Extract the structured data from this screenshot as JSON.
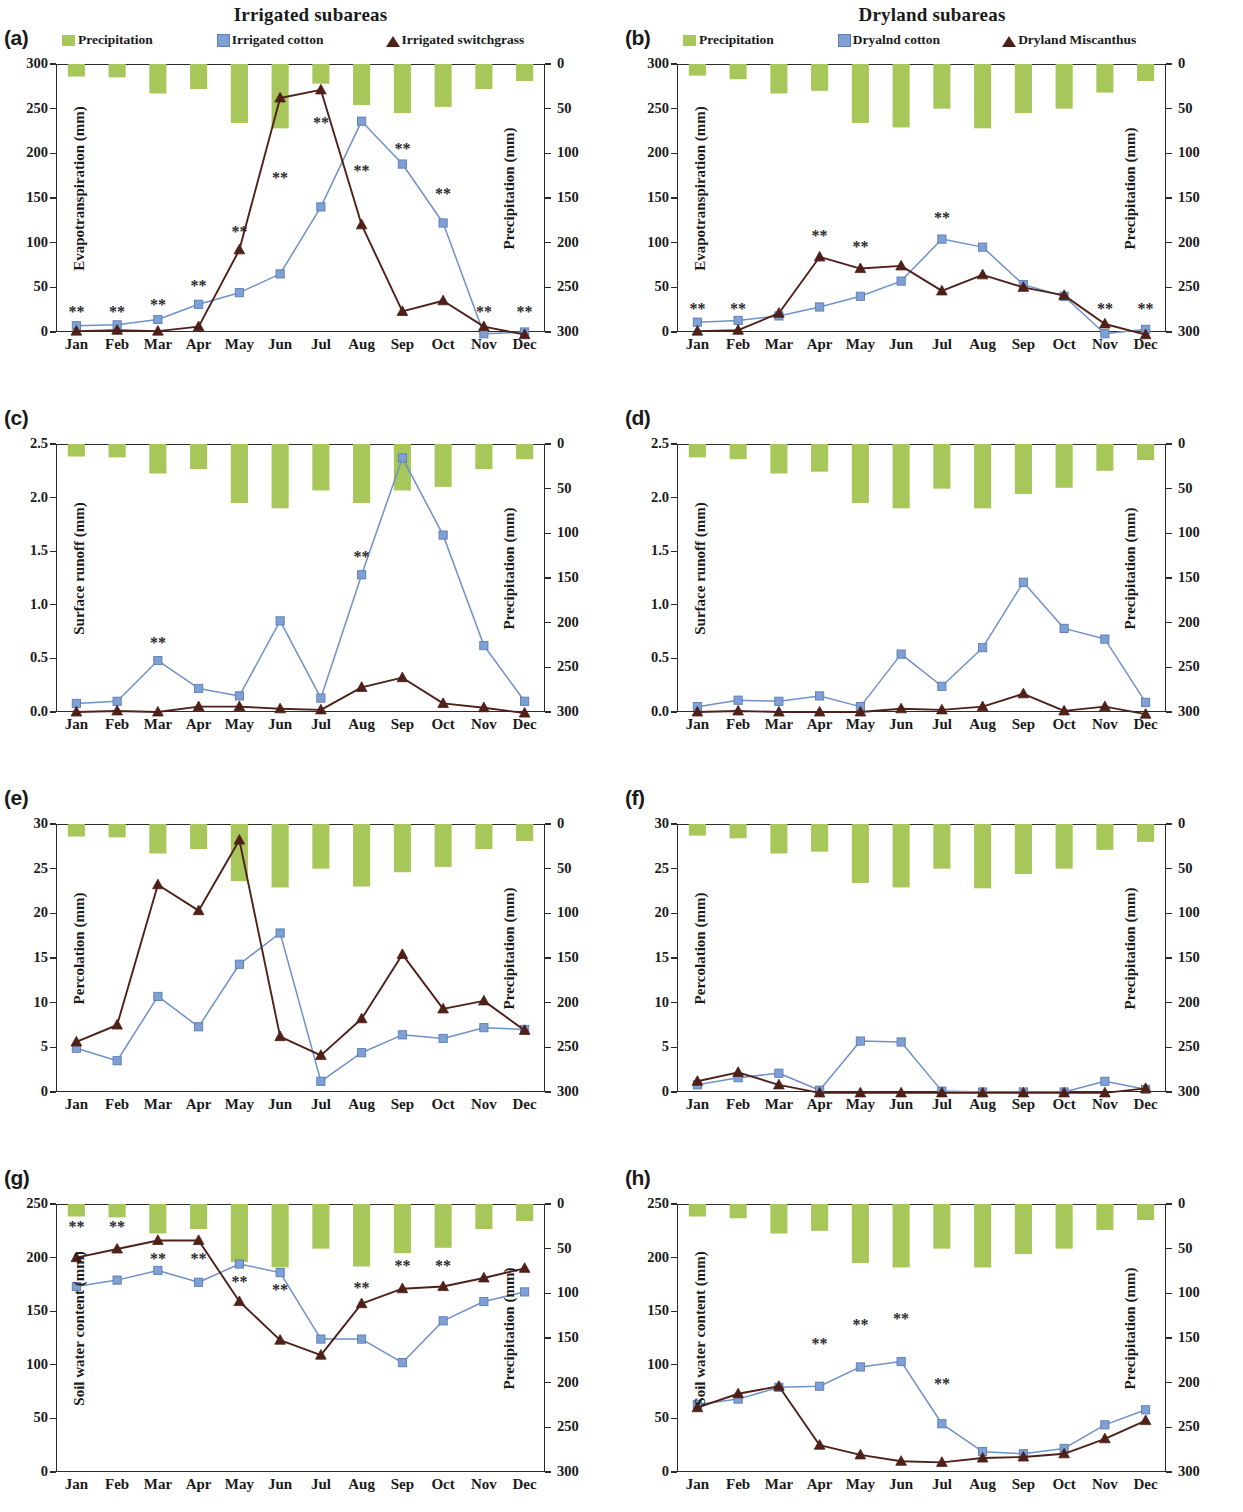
{
  "figure": {
    "titles": {
      "left": "Irrigated subareas",
      "right": "Dryland subareas"
    },
    "months": [
      "Jan",
      "Feb",
      "Mar",
      "Apr",
      "May",
      "Jun",
      "Jul",
      "Aug",
      "Sep",
      "Oct",
      "Nov",
      "Dec"
    ],
    "colors": {
      "precipitation": "#a8c75a",
      "cotton": "#7fa0d4",
      "cotton_line": "#6f91c8",
      "perennial": "#4e2018",
      "axis": "#2b2b2b"
    },
    "precip_axis": {
      "label": "Precipitation (mm)",
      "ticks": [
        "0",
        "50",
        "100",
        "150",
        "200",
        "250",
        "300"
      ],
      "min": 0,
      "max": 300,
      "inverted": true
    },
    "significance_marker": "**"
  },
  "chart_data": [
    {
      "id": "a",
      "panel_letter": "(a)",
      "type": "line",
      "column": "left",
      "title": "Irrigated subareas",
      "ylabel": "Evapotranspiration  (mm)",
      "y2label": "Precipitation (mm)",
      "xlabel": "",
      "ylim": [
        0,
        300
      ],
      "yticks": [
        "0",
        "50",
        "100",
        "150",
        "200",
        "250",
        "300"
      ],
      "y2lim": [
        0,
        300
      ],
      "y2ticks": [
        "0",
        "50",
        "100",
        "150",
        "200",
        "250",
        "300"
      ],
      "grid": false,
      "legend": [
        {
          "name": "Precipitation",
          "marker": "bar",
          "color": "#a8c75a"
        },
        {
          "name": "Irrigated cotton",
          "marker": "square",
          "color": "#7fa0d4"
        },
        {
          "name": "Irrigated switchgrass",
          "marker": "triangle",
          "color": "#4e2018"
        }
      ],
      "categories": [
        "Jan",
        "Feb",
        "Mar",
        "Apr",
        "May",
        "Jun",
        "Jul",
        "Aug",
        "Sep",
        "Oct",
        "Nov",
        "Dec"
      ],
      "series": [
        {
          "name": "Precipitation",
          "axis": "right",
          "kind": "bar",
          "values": [
            14,
            15,
            33,
            28,
            66,
            72,
            22,
            46,
            55,
            48,
            28,
            19
          ]
        },
        {
          "name": "Irrigated cotton",
          "axis": "left",
          "kind": "line",
          "values": [
            7,
            8,
            14,
            31,
            44,
            65,
            140,
            236,
            188,
            122,
            -2,
            0
          ]
        },
        {
          "name": "Irrigated switchgrass",
          "axis": "left",
          "kind": "line",
          "values": [
            1,
            2,
            1,
            6,
            92,
            262,
            271,
            120,
            23,
            35,
            6,
            -3
          ]
        }
      ],
      "significance": [
        {
          "month": "Jan",
          "x_index": 0,
          "y": 22
        },
        {
          "month": "Feb",
          "x_index": 1,
          "y": 22
        },
        {
          "month": "Mar",
          "x_index": 2,
          "y": 30
        },
        {
          "month": "Apr",
          "x_index": 3,
          "y": 52
        },
        {
          "month": "May",
          "x_index": 4,
          "y": 112
        },
        {
          "month": "Jun",
          "x_index": 5,
          "y": 172
        },
        {
          "month": "Jul",
          "x_index": 6,
          "y": 234
        },
        {
          "month": "Aug",
          "x_index": 7,
          "y": 180
        },
        {
          "month": "Sep",
          "x_index": 8,
          "y": 205
        },
        {
          "month": "Oct",
          "x_index": 9,
          "y": 155
        },
        {
          "month": "Nov",
          "x_index": 10,
          "y": 22
        },
        {
          "month": "Dec",
          "x_index": 11,
          "y": 22
        }
      ]
    },
    {
      "id": "b",
      "panel_letter": "(b)",
      "type": "line",
      "column": "right",
      "title": "Dryland subareas",
      "ylabel": "Evapotranspiration  (mm)",
      "y2label": "Precipitation (mm)",
      "xlabel": "",
      "ylim": [
        0,
        300
      ],
      "yticks": [
        "0",
        "50",
        "100",
        "150",
        "200",
        "250",
        "300"
      ],
      "y2lim": [
        0,
        300
      ],
      "y2ticks": [
        "0",
        "50",
        "100",
        "150",
        "200",
        "250",
        "300"
      ],
      "grid": false,
      "legend": [
        {
          "name": "Precipitation",
          "marker": "bar",
          "color": "#a8c75a"
        },
        {
          "name": "Dryalnd cotton",
          "marker": "square",
          "color": "#7fa0d4"
        },
        {
          "name": "Dryland Miscanthus",
          "marker": "triangle",
          "color": "#4e2018"
        }
      ],
      "categories": [
        "Jan",
        "Feb",
        "Mar",
        "Apr",
        "May",
        "Jun",
        "Jul",
        "Aug",
        "Sep",
        "Oct",
        "Nov",
        "Dec"
      ],
      "series": [
        {
          "name": "Precipitation",
          "axis": "right",
          "kind": "bar",
          "values": [
            13,
            17,
            33,
            30,
            66,
            71,
            50,
            72,
            55,
            50,
            32,
            19
          ]
        },
        {
          "name": "Dryalnd cotton",
          "axis": "left",
          "kind": "line",
          "values": [
            11,
            13,
            18,
            28,
            40,
            57,
            104,
            95,
            53,
            40,
            -2,
            3
          ]
        },
        {
          "name": "Dryland Miscanthus",
          "axis": "left",
          "kind": "line",
          "values": [
            1,
            2,
            21,
            84,
            71,
            74,
            46,
            64,
            50,
            41,
            9,
            -3
          ]
        }
      ],
      "significance": [
        {
          "month": "Jan",
          "x_index": 0,
          "y": 26
        },
        {
          "month": "Feb",
          "x_index": 1,
          "y": 26
        },
        {
          "month": "Apr",
          "x_index": 3,
          "y": 108
        },
        {
          "month": "May",
          "x_index": 4,
          "y": 95
        },
        {
          "month": "Jul",
          "x_index": 6,
          "y": 128
        },
        {
          "month": "Nov",
          "x_index": 10,
          "y": 26
        },
        {
          "month": "Dec",
          "x_index": 11,
          "y": 26
        }
      ]
    },
    {
      "id": "c",
      "panel_letter": "(c)",
      "type": "line",
      "column": "left",
      "title": "",
      "ylabel": "Surface runoff (mm)",
      "y2label": "Precipitation (mm)",
      "xlabel": "",
      "ylim": [
        0,
        2.5
      ],
      "yticks": [
        "0.0",
        "0.5",
        "1.0",
        "1.5",
        "2.0",
        "2.5"
      ],
      "y2lim": [
        0,
        300
      ],
      "y2ticks": [
        "0",
        "50",
        "100",
        "150",
        "200",
        "250",
        "300"
      ],
      "grid": false,
      "legend": [],
      "categories": [
        "Jan",
        "Feb",
        "Mar",
        "Apr",
        "May",
        "Jun",
        "Jul",
        "Aug",
        "Sep",
        "Oct",
        "Nov",
        "Dec"
      ],
      "series": [
        {
          "name": "Precipitation",
          "axis": "right",
          "kind": "bar",
          "values": [
            14,
            15,
            33,
            28,
            66,
            72,
            52,
            66,
            52,
            48,
            28,
            17
          ]
        },
        {
          "name": "Irrigated cotton",
          "axis": "left",
          "kind": "line",
          "values": [
            0.08,
            0.1,
            0.48,
            0.22,
            0.15,
            0.85,
            0.13,
            1.28,
            2.37,
            1.65,
            0.62,
            0.1
          ]
        },
        {
          "name": "Irrigated switchgrass",
          "axis": "left",
          "kind": "line",
          "values": [
            0.0,
            0.01,
            0.0,
            0.05,
            0.05,
            0.03,
            0.02,
            0.23,
            0.32,
            0.08,
            0.04,
            -0.01
          ]
        }
      ],
      "significance": [
        {
          "month": "Mar",
          "x_index": 2,
          "y": 0.64
        },
        {
          "month": "Aug",
          "x_index": 7,
          "y": 1.45
        }
      ]
    },
    {
      "id": "d",
      "panel_letter": "(d)",
      "type": "line",
      "column": "right",
      "title": "",
      "ylabel": "Surface runoff (mm)",
      "y2label": "Precipitation (mm)",
      "xlabel": "",
      "ylim": [
        0,
        2.5
      ],
      "yticks": [
        "0.0",
        "0.5",
        "1.0",
        "1.5",
        "2.0",
        "2.5"
      ],
      "y2lim": [
        0,
        300
      ],
      "y2ticks": [
        "0",
        "50",
        "100",
        "150",
        "200",
        "250",
        "300"
      ],
      "grid": false,
      "legend": [],
      "categories": [
        "Jan",
        "Feb",
        "Mar",
        "Apr",
        "May",
        "Jun",
        "Jul",
        "Aug",
        "Sep",
        "Oct",
        "Nov",
        "Dec"
      ],
      "series": [
        {
          "name": "Precipitation",
          "axis": "right",
          "kind": "bar",
          "values": [
            15,
            17,
            33,
            31,
            66,
            72,
            50,
            72,
            56,
            49,
            30,
            18
          ]
        },
        {
          "name": "Dryalnd cotton",
          "axis": "left",
          "kind": "line",
          "values": [
            0.05,
            0.11,
            0.1,
            0.15,
            0.05,
            0.54,
            0.24,
            0.6,
            1.21,
            0.78,
            0.68,
            0.09
          ]
        },
        {
          "name": "Dryland Miscanthus",
          "axis": "left",
          "kind": "line",
          "values": [
            0.0,
            0.01,
            0.0,
            0.0,
            0.0,
            0.03,
            0.02,
            0.05,
            0.17,
            0.01,
            0.05,
            -0.02
          ]
        }
      ],
      "significance": []
    },
    {
      "id": "e",
      "panel_letter": "(e)",
      "type": "line",
      "column": "left",
      "title": "",
      "ylabel": "Percolation (mm)",
      "y2label": "Precipitation (mm)",
      "xlabel": "",
      "ylim": [
        0,
        30
      ],
      "yticks": [
        "0",
        "5",
        "10",
        "15",
        "20",
        "25",
        "30"
      ],
      "y2lim": [
        0,
        300
      ],
      "y2ticks": [
        "0",
        "50",
        "100",
        "150",
        "200",
        "250",
        "300"
      ],
      "grid": false,
      "legend": [],
      "categories": [
        "Jan",
        "Feb",
        "Mar",
        "Apr",
        "May",
        "Jun",
        "Jul",
        "Aug",
        "Sep",
        "Oct",
        "Nov",
        "Dec"
      ],
      "series": [
        {
          "name": "Precipitation",
          "axis": "right",
          "kind": "bar",
          "values": [
            14,
            15,
            33,
            28,
            64,
            71,
            50,
            70,
            54,
            48,
            28,
            19
          ]
        },
        {
          "name": "Irrigated cotton",
          "axis": "left",
          "kind": "line",
          "values": [
            4.9,
            3.5,
            10.7,
            7.3,
            14.3,
            17.8,
            1.2,
            4.4,
            6.4,
            6.0,
            7.2,
            7.0
          ]
        },
        {
          "name": "Irrigated switchgrass",
          "axis": "left",
          "kind": "line",
          "values": [
            5.6,
            7.5,
            23.2,
            20.3,
            28.2,
            6.2,
            4.1,
            8.2,
            15.4,
            9.3,
            10.2,
            6.9
          ]
        }
      ],
      "significance": []
    },
    {
      "id": "f",
      "panel_letter": "(f)",
      "type": "line",
      "column": "right",
      "title": "",
      "ylabel": "Percolation (mm)",
      "y2label": "Precipitation (mm)",
      "xlabel": "",
      "ylim": [
        0,
        30
      ],
      "yticks": [
        "0",
        "5",
        "10",
        "15",
        "20",
        "25",
        "30"
      ],
      "y2lim": [
        0,
        300
      ],
      "y2ticks": [
        "0",
        "50",
        "100",
        "150",
        "200",
        "250",
        "300"
      ],
      "grid": false,
      "legend": [],
      "categories": [
        "Jan",
        "Feb",
        "Mar",
        "Apr",
        "May",
        "Jun",
        "Jul",
        "Aug",
        "Sep",
        "Oct",
        "Nov",
        "Dec"
      ],
      "series": [
        {
          "name": "Precipitation",
          "axis": "right",
          "kind": "bar",
          "values": [
            13,
            16,
            33,
            31,
            66,
            71,
            50,
            72,
            56,
            50,
            29,
            20
          ]
        },
        {
          "name": "Dryalnd cotton",
          "axis": "left",
          "kind": "line",
          "values": [
            0.8,
            1.6,
            2.1,
            0.2,
            5.7,
            5.6,
            0.1,
            0.0,
            0.0,
            0.0,
            1.2,
            0.3
          ]
        },
        {
          "name": "Dryland Miscanthus",
          "axis": "left",
          "kind": "line",
          "values": [
            1.2,
            2.2,
            0.8,
            -0.1,
            -0.1,
            -0.1,
            -0.1,
            -0.1,
            -0.1,
            -0.1,
            -0.1,
            0.4
          ]
        }
      ],
      "significance": []
    },
    {
      "id": "g",
      "panel_letter": "(g)",
      "type": "line",
      "column": "left",
      "title": "",
      "ylabel": "Soil water content (mm)",
      "y2label": "Precipitation (mm)",
      "xlabel": "",
      "ylim": [
        0,
        250
      ],
      "yticks": [
        "0",
        "50",
        "100",
        "150",
        "200",
        "250"
      ],
      "y2lim": [
        0,
        300
      ],
      "y2ticks": [
        "0",
        "50",
        "100",
        "150",
        "200",
        "250",
        "300"
      ],
      "grid": false,
      "legend": [],
      "categories": [
        "Jan",
        "Feb",
        "Mar",
        "Apr",
        "May",
        "Jun",
        "Jul",
        "Aug",
        "Sep",
        "Oct",
        "Nov",
        "Dec"
      ],
      "series": [
        {
          "name": "Precipitation",
          "axis": "right",
          "kind": "bar",
          "values": [
            14,
            15,
            33,
            28,
            65,
            71,
            50,
            70,
            55,
            49,
            28,
            19
          ]
        },
        {
          "name": "Irrigated cotton",
          "axis": "left",
          "kind": "line",
          "values": [
            173,
            179,
            188,
            177,
            194,
            186,
            124,
            124,
            102,
            141,
            159,
            168
          ]
        },
        {
          "name": "Irrigated switchgrass",
          "axis": "left",
          "kind": "line",
          "values": [
            200,
            208,
            216,
            216,
            159,
            123,
            109,
            157,
            171,
            173,
            181,
            190
          ]
        }
      ],
      "significance": [
        {
          "month": "Jan",
          "x_index": 0,
          "y": 229
        },
        {
          "month": "Feb",
          "x_index": 1,
          "y": 229
        },
        {
          "month": "Mar",
          "x_index": 2,
          "y": 199
        },
        {
          "month": "Apr",
          "x_index": 3,
          "y": 199
        },
        {
          "month": "May",
          "x_index": 4,
          "y": 177
        },
        {
          "month": "Jun",
          "x_index": 5,
          "y": 170
        },
        {
          "month": "Aug",
          "x_index": 7,
          "y": 172
        },
        {
          "month": "Sep",
          "x_index": 8,
          "y": 192
        },
        {
          "month": "Oct",
          "x_index": 9,
          "y": 192
        }
      ]
    },
    {
      "id": "h",
      "panel_letter": "(h)",
      "type": "line",
      "column": "right",
      "title": "",
      "ylabel": "Soil water content (mm)",
      "y2label": "Precipitation (mm)",
      "xlabel": "",
      "ylim": [
        0,
        250
      ],
      "yticks": [
        "0",
        "50",
        "100",
        "150",
        "200",
        "250"
      ],
      "y2lim": [
        0,
        300
      ],
      "y2ticks": [
        "0",
        "50",
        "100",
        "150",
        "200",
        "250",
        "300"
      ],
      "grid": false,
      "legend": [],
      "categories": [
        "Jan",
        "Feb",
        "Mar",
        "Apr",
        "May",
        "Jun",
        "Jul",
        "Aug",
        "Sep",
        "Oct",
        "Nov",
        "Dec"
      ],
      "series": [
        {
          "name": "Precipitation",
          "axis": "right",
          "kind": "bar",
          "values": [
            14,
            16,
            33,
            30,
            66,
            71,
            50,
            71,
            56,
            50,
            29,
            18
          ]
        },
        {
          "name": "Dryalnd cotton",
          "axis": "left",
          "kind": "line",
          "values": [
            63,
            68,
            79,
            80,
            98,
            103,
            45,
            19,
            17,
            22,
            44,
            58
          ]
        },
        {
          "name": "Dryland Miscanthus",
          "axis": "left",
          "kind": "line",
          "values": [
            60,
            73,
            80,
            25,
            16,
            10,
            9,
            13,
            14,
            17,
            31,
            48
          ]
        }
      ],
      "significance": [
        {
          "month": "Apr",
          "x_index": 3,
          "y": 119
        },
        {
          "month": "May",
          "x_index": 4,
          "y": 137
        },
        {
          "month": "Jun",
          "x_index": 5,
          "y": 143
        },
        {
          "month": "Jul",
          "x_index": 6,
          "y": 82
        }
      ]
    }
  ]
}
